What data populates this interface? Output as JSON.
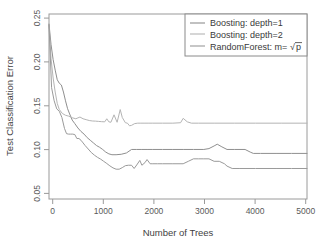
{
  "chart_data": {
    "type": "line",
    "title": "",
    "xlabel": "Number of Trees",
    "ylabel": "Test Classification Error",
    "xlim": [
      0,
      5000
    ],
    "ylim": [
      0.046,
      0.257
    ],
    "xticks": [
      0,
      1000,
      2000,
      3000,
      4000,
      5000
    ],
    "xtick_labels": [
      "0",
      "1000",
      "2000",
      "3000",
      "4000",
      "5000"
    ],
    "yticks": [
      0.05,
      0.1,
      0.15,
      0.2,
      0.25
    ],
    "ytick_labels": [
      "0.05",
      "0.10",
      "0.15",
      "0.20",
      "0.25"
    ],
    "grid": false,
    "legend_position": "top-right",
    "series": [
      {
        "name": "Boosting: depth=1",
        "color": "#8f8f8f",
        "final_value": 0.098,
        "x": [
          0,
          40,
          80,
          120,
          160,
          200,
          240,
          280,
          320,
          360,
          400,
          450,
          500,
          560,
          620,
          680,
          740,
          800,
          860,
          920,
          980,
          1040,
          1100,
          1160,
          1220,
          1300,
          1400,
          1500,
          1600,
          1700,
          1800,
          1900,
          2000,
          2200,
          2400,
          2600,
          2800,
          3000,
          3100,
          3200,
          3260,
          3350,
          3450,
          3600,
          3800,
          3900,
          3960,
          4100,
          4400,
          4700,
          5000
        ],
        "y": [
          0.2455,
          0.222,
          0.205,
          0.193,
          0.182,
          0.178,
          0.176,
          0.168,
          0.158,
          0.149,
          0.143,
          0.136,
          0.132,
          0.127,
          0.123,
          0.12,
          0.116,
          0.113,
          0.11,
          0.107,
          0.105,
          0.1025,
          0.0995,
          0.0975,
          0.0965,
          0.0965,
          0.097,
          0.0985,
          0.1025,
          0.1025,
          0.1025,
          0.1025,
          0.1025,
          0.1025,
          0.1025,
          0.1025,
          0.1025,
          0.1025,
          0.1035,
          0.1065,
          0.1085,
          0.1055,
          0.1025,
          0.1025,
          0.1025,
          0.0995,
          0.098,
          0.098,
          0.098,
          0.098,
          0.098
        ]
      },
      {
        "name": "Boosting: depth=2",
        "color": "#b4b4b4",
        "final_value": 0.1325,
        "x": [
          0,
          40,
          80,
          120,
          160,
          200,
          260,
          320,
          380,
          420,
          460,
          520,
          560,
          600,
          660,
          720,
          780,
          840,
          900,
          960,
          1020,
          1080,
          1120,
          1160,
          1200,
          1260,
          1320,
          1380,
          1420,
          1480,
          1520,
          1560,
          1600,
          1660,
          1720,
          1780,
          1860,
          1920,
          2000,
          2200,
          2400,
          2550,
          2600,
          2680,
          2760,
          2900,
          3200,
          3600,
          4000,
          4500,
          5000
        ],
        "y": [
          0.245,
          0.206,
          0.184,
          0.168,
          0.155,
          0.148,
          0.1435,
          0.1415,
          0.1405,
          0.1395,
          0.1385,
          0.1375,
          0.1385,
          0.1395,
          0.1375,
          0.1365,
          0.1355,
          0.135,
          0.1348,
          0.1345,
          0.1342,
          0.134,
          0.1375,
          0.134,
          0.1335,
          0.142,
          0.1335,
          0.148,
          0.139,
          0.133,
          0.1325,
          0.1295,
          0.13,
          0.132,
          0.1325,
          0.1325,
          0.1325,
          0.1325,
          0.1325,
          0.1325,
          0.1325,
          0.133,
          0.138,
          0.134,
          0.1325,
          0.1325,
          0.1325,
          0.1325,
          0.1325,
          0.1325,
          0.1325
        ]
      },
      {
        "name": "RandomForest: m=√p",
        "color": "#9a9a9a",
        "final_value": 0.0808,
        "x": [
          0,
          50,
          100,
          150,
          200,
          250,
          300,
          340,
          380,
          420,
          460,
          500,
          540,
          580,
          620,
          660,
          700,
          760,
          820,
          880,
          940,
          1000,
          1060,
          1120,
          1180,
          1240,
          1300,
          1360,
          1420,
          1480,
          1540,
          1600,
          1650,
          1700,
          1760,
          1800,
          1860,
          1900,
          1960,
          2000,
          2100,
          2200,
          2400,
          2600,
          2700,
          2800,
          2900,
          3000,
          3100,
          3200,
          3300,
          3400,
          3450,
          3550,
          3700,
          4000,
          4400,
          4700,
          5000
        ],
        "y": [
          0.2445,
          0.173,
          0.158,
          0.1488,
          0.146,
          0.139,
          0.1265,
          0.1205,
          0.12,
          0.12,
          0.12,
          0.1195,
          0.115,
          0.115,
          0.113,
          0.11,
          0.107,
          0.103,
          0.099,
          0.096,
          0.0935,
          0.0915,
          0.089,
          0.0865,
          0.0838,
          0.0815,
          0.08,
          0.08,
          0.0818,
          0.084,
          0.0845,
          0.0845,
          0.0808,
          0.0848,
          0.09,
          0.0845,
          0.0875,
          0.091,
          0.0862,
          0.0862,
          0.0862,
          0.0862,
          0.0862,
          0.0862,
          0.089,
          0.0918,
          0.0918,
          0.0918,
          0.0918,
          0.089,
          0.089,
          0.0862,
          0.0835,
          0.0808,
          0.0808,
          0.0808,
          0.0808,
          0.0808,
          0.0808
        ]
      }
    ]
  },
  "legend": {
    "entries": [
      {
        "label": "Boosting: depth=1"
      },
      {
        "label": "Boosting: depth=2"
      },
      {
        "label": "RandomForest: m="
      }
    ],
    "rf_math": {
      "radical": "√",
      "operand": "p"
    }
  }
}
